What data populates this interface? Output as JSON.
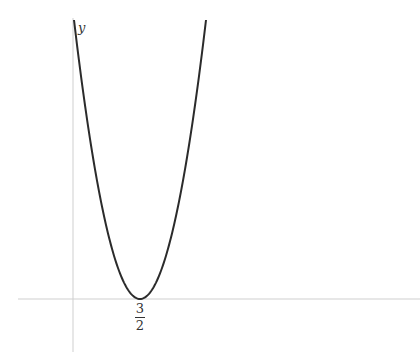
{
  "chart_data": {
    "type": "line",
    "title": "",
    "xlabel": "",
    "ylabel": "y",
    "function": "f(x) = a(x - 3/2)^2",
    "vertex": {
      "x": 1.5,
      "y": 0,
      "label": "3/2"
    },
    "x_tick_labels": [
      {
        "value": 1.5,
        "numerator": "3",
        "denominator": "2"
      }
    ],
    "grid": false,
    "legend": null
  },
  "axes": {
    "y_label": "y"
  },
  "tick": {
    "numerator": "3",
    "denominator": "2"
  }
}
